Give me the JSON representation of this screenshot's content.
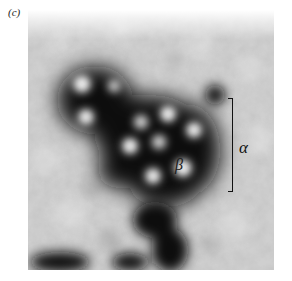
{
  "figure": {
    "panel_label": "(c)",
    "image_type": "electron micrograph, grayscale",
    "annotations": {
      "alpha_label": "α",
      "beta_label": "β",
      "bracket_marks": "α"
    },
    "colors": {
      "background": "#ffffff",
      "image_light": "#d8d8d8",
      "image_dark": "#141414",
      "annotation_ink": "#111111"
    }
  }
}
